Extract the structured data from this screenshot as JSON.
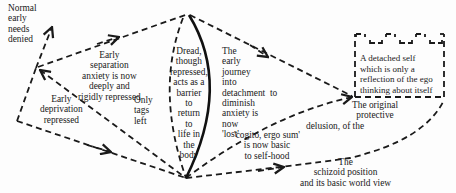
{
  "diagram": {
    "colors": {
      "ink": "#1a1a1a",
      "background": "#fdfdfd"
    },
    "labels": {
      "normal_needs": "Normal\nearly\nneeds\ndenied",
      "early_separation": "Early\nseparation\nanxiety is now\ndeeply and\nrigidly repressed",
      "early_deprivation": "Early\ndeprivation\nrepressed",
      "only_tags": "Only\ntags\nleft",
      "dread": "Dread,\nthough\nrepressed,\nacts as a\nbarrier\nto\nreturn\nto\nlife in\nthe\nbody",
      "early_journey": "The\nearly\njourney\ninto\ndetachment  to\ndiminish\nanxiety is\nnow\n'lost'",
      "cogito": "'cogito, ergo sum'\nis now basic\nto self-hood",
      "original_delusion_top": "The original\nprotective",
      "original_delusion_bottom": "delusion, of the",
      "schizoid_position": "The\nschizoid position\nand its basic world view",
      "detached_self": "A detached self\nwhich is only a\nreflection of the ego\nthinking about itself"
    }
  }
}
